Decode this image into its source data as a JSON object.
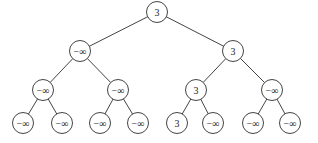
{
  "tree": {
    "radius": 10.5,
    "nodes": [
      {
        "id": 0,
        "label": "3",
        "x": 157,
        "y": 12
      },
      {
        "id": 1,
        "label": "−∞",
        "x": 80,
        "y": 51
      },
      {
        "id": 2,
        "label": "3",
        "x": 233,
        "y": 51
      },
      {
        "id": 3,
        "label": "−∞",
        "x": 43,
        "y": 90
      },
      {
        "id": 4,
        "label": "−∞",
        "x": 118,
        "y": 90
      },
      {
        "id": 5,
        "label": "3",
        "x": 196,
        "y": 90
      },
      {
        "id": 6,
        "label": "−∞",
        "x": 272,
        "y": 90
      },
      {
        "id": 7,
        "label": "−∞",
        "x": 23,
        "y": 123
      },
      {
        "id": 8,
        "label": "−∞",
        "x": 62,
        "y": 123
      },
      {
        "id": 9,
        "label": "−∞",
        "x": 100,
        "y": 123
      },
      {
        "id": 10,
        "label": "−∞",
        "x": 138,
        "y": 123
      },
      {
        "id": 11,
        "label": "3",
        "x": 177,
        "y": 123
      },
      {
        "id": 12,
        "label": "−∞",
        "x": 213,
        "y": 123
      },
      {
        "id": 13,
        "label": "−∞",
        "x": 253,
        "y": 123
      },
      {
        "id": 14,
        "label": "−∞",
        "x": 290,
        "y": 123
      }
    ],
    "edges": [
      [
        0,
        1
      ],
      [
        0,
        2
      ],
      [
        1,
        3
      ],
      [
        1,
        4
      ],
      [
        2,
        5
      ],
      [
        2,
        6
      ],
      [
        3,
        7
      ],
      [
        3,
        8
      ],
      [
        4,
        9
      ],
      [
        4,
        10
      ],
      [
        5,
        11
      ],
      [
        5,
        12
      ],
      [
        6,
        13
      ],
      [
        6,
        14
      ]
    ]
  }
}
